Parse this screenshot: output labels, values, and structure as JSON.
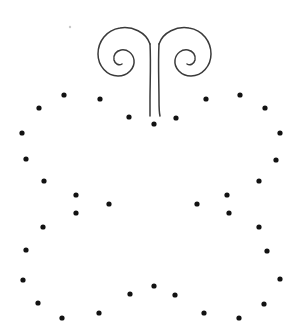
{
  "canvas": {
    "width": 307,
    "height": 335,
    "background_color": "#ffffff",
    "title": "Dotted pumpkin outline with curled stem"
  },
  "style": {
    "dot_color": "#121212",
    "dot_radius": 2.6,
    "stroke_color": "#3a3a3a",
    "stroke_width": 1.5,
    "speck_color": "#c9c9c9",
    "speck_radius": 1.2
  },
  "artwork": {
    "name": "pumpkin-dot-outline",
    "flourish": {
      "name": "double-spiral-stem",
      "left_curl_path": "M 150 44 C 146 32 132 26 120 28 C 106 30 98 42 98 54 C 98 66 107 76 118 76 C 128 76 135 68 134 60 C 133 53 127 49 121 50 C 116 51 113 55 114 60 C 115 64 119 66 122 64",
      "left_stem_path": "M 150 44 C 151 62 150 84 150 100 C 150 108 150 112 150 116",
      "right_curl_path": "M 159 44 C 163 32 177 26 189 28 C 203 30 211 42 211 54 C 211 66 202 76 191 76 C 181 76 174 68 175 60 C 176 53 182 49 188 50 C 193 51 196 55 195 60 C 194 64 190 66 187 64",
      "right_stem_path": "M 159 44 C 158 62 159 84 159 100 C 159 108 159 112 160 116"
    },
    "dots": [
      {
        "name": "dot-top-center-left",
        "x": 129,
        "y": 117
      },
      {
        "name": "dot-top-center",
        "x": 154,
        "y": 124
      },
      {
        "name": "dot-top-center-right",
        "x": 176,
        "y": 118
      },
      {
        "name": "dot-top-arc-1",
        "x": 64,
        "y": 95
      },
      {
        "name": "dot-top-arc-2",
        "x": 39,
        "y": 108
      },
      {
        "name": "dot-top-arc-3",
        "x": 100,
        "y": 99
      },
      {
        "name": "dot-top-arc-4",
        "x": 206,
        "y": 99
      },
      {
        "name": "dot-top-arc-5",
        "x": 240,
        "y": 95
      },
      {
        "name": "dot-top-arc-6",
        "x": 265,
        "y": 108
      },
      {
        "name": "dot-left-edge-1",
        "x": 22,
        "y": 133
      },
      {
        "name": "dot-left-edge-2",
        "x": 26,
        "y": 159
      },
      {
        "name": "dot-left-edge-3",
        "x": 44,
        "y": 181
      },
      {
        "name": "dot-left-edge-4",
        "x": 43,
        "y": 227
      },
      {
        "name": "dot-left-edge-5",
        "x": 26,
        "y": 250
      },
      {
        "name": "dot-left-edge-6",
        "x": 23,
        "y": 280
      },
      {
        "name": "dot-right-edge-1",
        "x": 280,
        "y": 133
      },
      {
        "name": "dot-right-edge-2",
        "x": 276,
        "y": 160
      },
      {
        "name": "dot-right-edge-3",
        "x": 259,
        "y": 181
      },
      {
        "name": "dot-right-edge-4",
        "x": 259,
        "y": 227
      },
      {
        "name": "dot-right-edge-5",
        "x": 267,
        "y": 251
      },
      {
        "name": "dot-right-edge-6",
        "x": 280,
        "y": 279
      },
      {
        "name": "dot-inner-left-rib-1",
        "x": 76,
        "y": 195
      },
      {
        "name": "dot-inner-left-rib-2",
        "x": 76,
        "y": 213
      },
      {
        "name": "dot-inner-left-rib-3",
        "x": 109,
        "y": 204
      },
      {
        "name": "dot-inner-right-rib-1",
        "x": 227,
        "y": 195
      },
      {
        "name": "dot-inner-right-rib-2",
        "x": 229,
        "y": 213
      },
      {
        "name": "dot-inner-right-rib-3",
        "x": 197,
        "y": 204
      },
      {
        "name": "dot-bottom-arc-1",
        "x": 38,
        "y": 303
      },
      {
        "name": "dot-bottom-arc-2",
        "x": 62,
        "y": 318
      },
      {
        "name": "dot-bottom-arc-3",
        "x": 99,
        "y": 313
      },
      {
        "name": "dot-bottom-arc-4",
        "x": 130,
        "y": 294
      },
      {
        "name": "dot-bottom-center",
        "x": 154,
        "y": 286
      },
      {
        "name": "dot-bottom-arc-5",
        "x": 175,
        "y": 295
      },
      {
        "name": "dot-bottom-arc-6",
        "x": 204,
        "y": 313
      },
      {
        "name": "dot-bottom-arc-7",
        "x": 239,
        "y": 318
      },
      {
        "name": "dot-bottom-arc-8",
        "x": 264,
        "y": 304
      }
    ],
    "speck": {
      "name": "faint-speck",
      "x": 70,
      "y": 27
    }
  }
}
